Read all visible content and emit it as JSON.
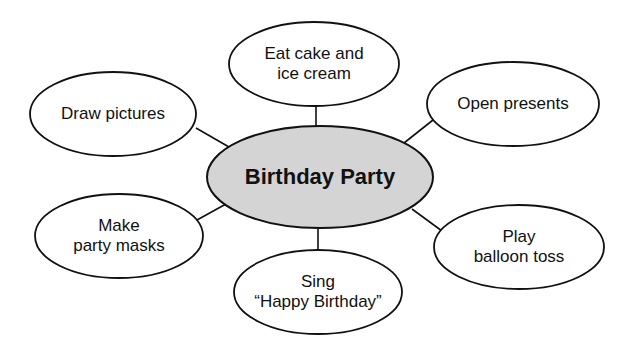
{
  "diagram": {
    "type": "web-graphic-organizer",
    "colors": {
      "background": "#ffffff",
      "stroke": "#111111",
      "center_fill": "#d4d4d4",
      "outer_fill": "#ffffff",
      "text": "#111111"
    },
    "center": {
      "label": "Birthday Party",
      "cx": 320,
      "cy": 177,
      "rx": 113,
      "ry": 51
    },
    "nodes": [
      {
        "id": "eat-cake",
        "lines": [
          "Eat cake and",
          "ice cream"
        ],
        "cx": 314,
        "cy": 64,
        "rx": 85,
        "ry": 42,
        "connector": {
          "x1": 316,
          "y1": 106,
          "x2": 316,
          "y2": 126
        }
      },
      {
        "id": "draw-pictures",
        "lines": [
          "Draw pictures"
        ],
        "cx": 113,
        "cy": 114,
        "rx": 83,
        "ry": 42,
        "connector": {
          "x1": 196,
          "y1": 128,
          "x2": 229,
          "y2": 147
        }
      },
      {
        "id": "open-presents",
        "lines": [
          "Open presents"
        ],
        "cx": 513,
        "cy": 104,
        "rx": 86,
        "ry": 42,
        "connector": {
          "x1": 433,
          "y1": 120,
          "x2": 404,
          "y2": 143
        }
      },
      {
        "id": "make-party-masks",
        "lines": [
          "Make",
          "party masks"
        ],
        "cx": 119,
        "cy": 236,
        "rx": 84,
        "ry": 42,
        "connector": {
          "x1": 197,
          "y1": 220,
          "x2": 226,
          "y2": 204
        }
      },
      {
        "id": "sing-happy-birthday",
        "lines": [
          "Sing",
          "“Happy Birthday”"
        ],
        "cx": 318,
        "cy": 292,
        "rx": 84,
        "ry": 42,
        "connector": {
          "x1": 318,
          "y1": 228,
          "x2": 318,
          "y2": 250
        }
      },
      {
        "id": "play-balloon-toss",
        "lines": [
          "Play",
          "balloon toss"
        ],
        "cx": 519,
        "cy": 247,
        "rx": 85,
        "ry": 42,
        "connector": {
          "x1": 412,
          "y1": 209,
          "x2": 442,
          "y2": 231
        }
      }
    ]
  }
}
